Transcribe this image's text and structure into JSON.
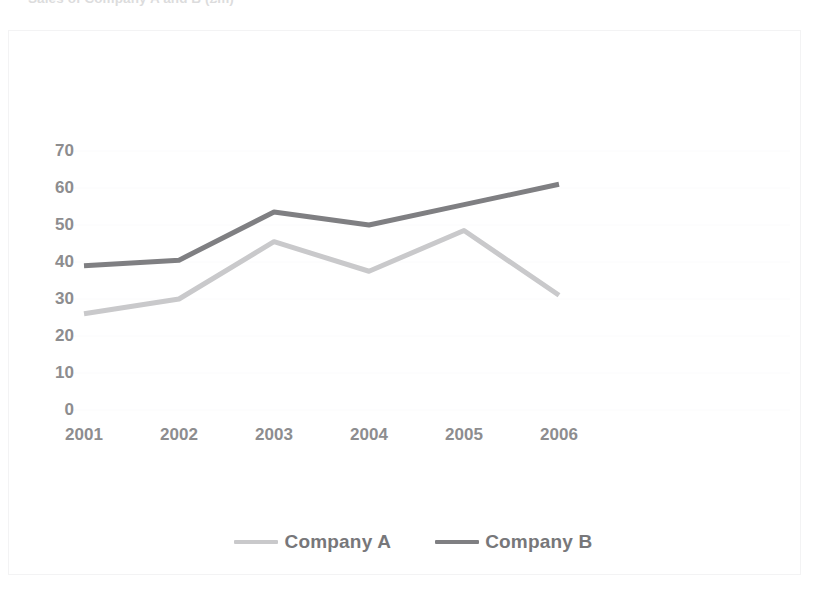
{
  "chart_data": {
    "type": "line",
    "title": "",
    "xlabel": "",
    "ylabel": "",
    "x": [
      "2001",
      "2002",
      "2003",
      "2004",
      "2005",
      "2006"
    ],
    "categories": [
      "2001",
      "2002",
      "2003",
      "2004",
      "2005",
      "2006"
    ],
    "series": [
      {
        "name": "Company A",
        "color": "#c9c9cb",
        "values": [
          26,
          30,
          45.5,
          37.5,
          48.5,
          31
        ]
      },
      {
        "name": "Company B",
        "color": "#7f7f82",
        "values": [
          39,
          40.5,
          53.5,
          50,
          55.5,
          61
        ]
      }
    ],
    "ylim": [
      0,
      70
    ],
    "yticks": [
      0,
      10,
      20,
      30,
      40,
      50,
      60,
      70
    ],
    "ytick_labels": [
      "0",
      "10",
      "20",
      "30",
      "40",
      "50",
      "60",
      "70"
    ],
    "grid": "faint-horizontal",
    "legend_position": "bottom",
    "markers": false,
    "annotations": []
  },
  "chart": {
    "title_partial": "Sales of Company A and B (£m)",
    "axis": {
      "y_labels": [
        "70",
        "60",
        "50",
        "40",
        "30",
        "20",
        "10",
        "0"
      ],
      "x_labels": [
        "2001",
        "2002",
        "2003",
        "2004",
        "2005",
        "2006"
      ]
    },
    "legend": {
      "items": [
        {
          "label": "Company A",
          "color": "#c9c9cb"
        },
        {
          "label": "Company B",
          "color": "#7f7f82"
        }
      ]
    },
    "colors": {
      "series_a": "#c9c9cb",
      "series_b": "#7f7f82",
      "text": "#8d8d8f",
      "legend_text": "#77777a",
      "frame": "#f3f3f4",
      "gridline": "#fbfbfc",
      "background": "#ffffff"
    }
  }
}
